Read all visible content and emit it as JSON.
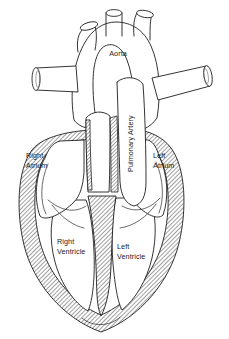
{
  "diagram": {
    "background_color": "#ffffff",
    "line_color": "#1d1d1d",
    "hatch_color": "#4a4a4a",
    "label_color": "#1a1a1a",
    "labels": [
      {
        "id": "aorta",
        "text": "Aorta",
        "line2": "",
        "x": 118,
        "y": 56,
        "anchor": "middle",
        "rotated": false
      },
      {
        "id": "right-atrium",
        "text": "Right",
        "line2": "Atrium",
        "x": 26,
        "y": 158,
        "anchor": "start",
        "rotated": false
      },
      {
        "id": "left-atrium",
        "text": "Left",
        "line2": "Atrium",
        "x": 153,
        "y": 158,
        "anchor": "start",
        "rotated": false
      },
      {
        "id": "right-ventricle",
        "text": "Right",
        "line2": "Ventricle",
        "x": 57,
        "y": 244,
        "anchor": "start",
        "rotated": false
      },
      {
        "id": "left-ventricle",
        "text": "Left",
        "line2": "Ventricle",
        "x": 117,
        "y": 249,
        "anchor": "start",
        "rotated": false
      },
      {
        "id": "pulmonary-artery",
        "text": "Pulmonary Artery",
        "line2": "",
        "x": 133,
        "y": 172,
        "anchor": "start",
        "rotated": true
      }
    ],
    "structures": [
      {
        "id": "aortic-arch",
        "name": "Aortic arch"
      },
      {
        "id": "brachiocephalic-trunk",
        "name": "Brachiocephalic trunk"
      },
      {
        "id": "left-carotid-artery",
        "name": "Left common carotid artery"
      },
      {
        "id": "left-subclavian-artery",
        "name": "Left subclavian artery"
      },
      {
        "id": "superior-vena-cava",
        "name": "Superior vena cava"
      },
      {
        "id": "pulmonary-branch",
        "name": "Right pulmonary artery branch"
      },
      {
        "id": "right-atrium-chamber",
        "name": "Right atrium chamber"
      },
      {
        "id": "left-atrium-chamber",
        "name": "Left atrium chamber"
      },
      {
        "id": "right-ventricle-chamber",
        "name": "Right ventricle chamber"
      },
      {
        "id": "left-ventricle-chamber",
        "name": "Left ventricle chamber"
      },
      {
        "id": "interventricular-septum",
        "name": "Interventricular septum"
      },
      {
        "id": "myocardium",
        "name": "Myocardium (hatched muscle wall)"
      },
      {
        "id": "tricuspid-valve",
        "name": "Tricuspid valve"
      },
      {
        "id": "mitral-valve",
        "name": "Mitral valve"
      },
      {
        "id": "cardiac-apex",
        "name": "Cardiac apex"
      }
    ]
  }
}
